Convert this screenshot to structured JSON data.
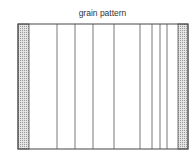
{
  "diagram": {
    "title": "grain pattern",
    "grain_lines_count": 8,
    "edge_pattern": "stippled"
  }
}
